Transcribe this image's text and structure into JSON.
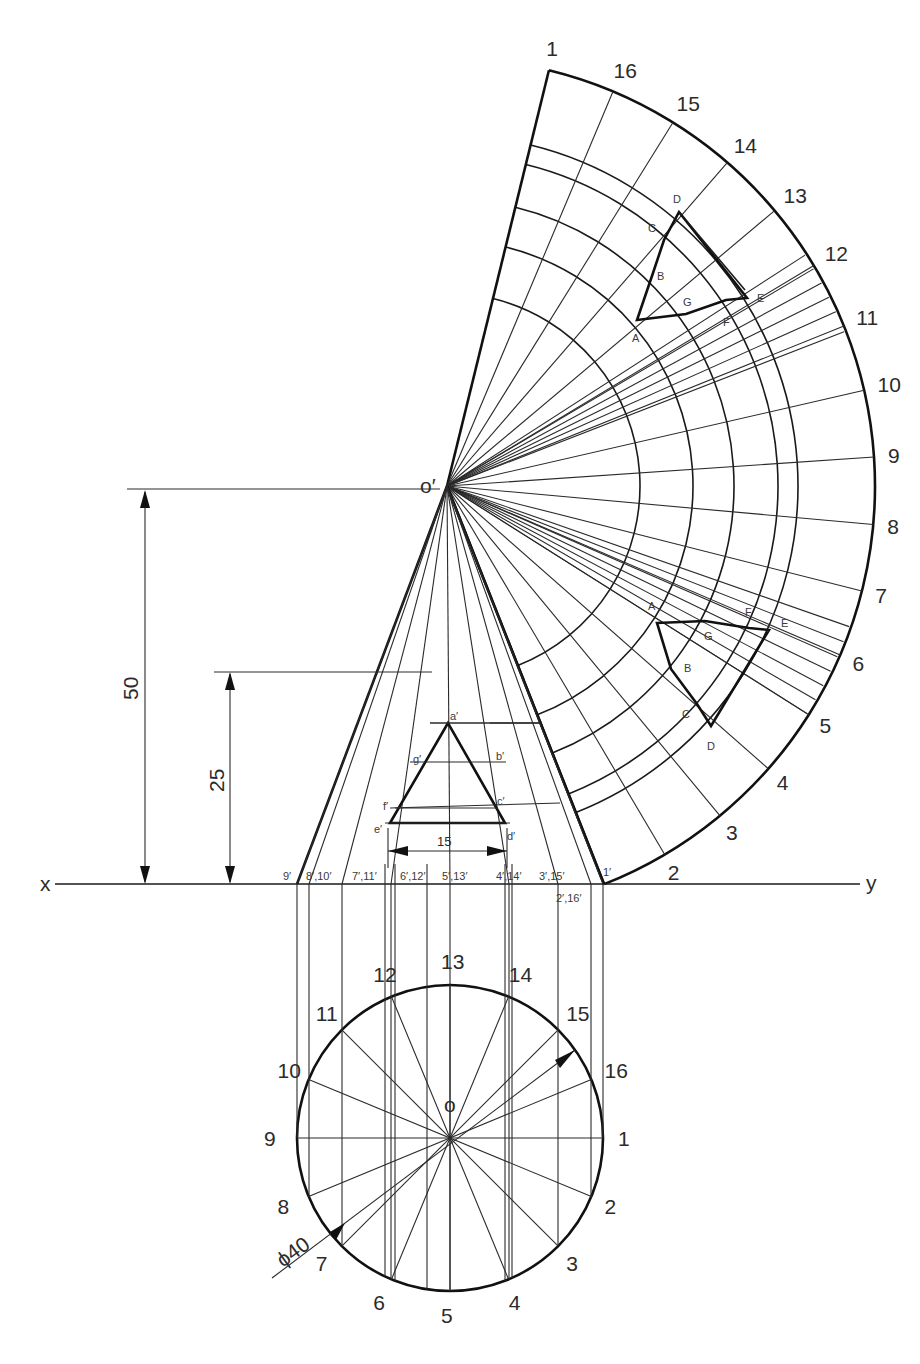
{
  "reference_line": {
    "left_label": "x",
    "right_label": "y"
  },
  "apex_elevation_label": "o′",
  "plan_center_label": "o",
  "dimensions": {
    "cone_height": "50",
    "section_height": "25",
    "triangle_base_width": "15",
    "base_diameter": "ϕ40"
  },
  "plan_generator_labels": [
    "1",
    "2",
    "3",
    "4",
    "5",
    "6",
    "7",
    "8",
    "9",
    "10",
    "11",
    "12",
    "13",
    "14",
    "15",
    "16"
  ],
  "elevation_base_labels": [
    "9′",
    "8′,10′",
    "7′,11′",
    "6′,12′",
    "5′,13′",
    "4′,14′",
    "3′,15′",
    "2′,16′",
    "1′"
  ],
  "elevation_triangle_labels": [
    "a′",
    "b′",
    "c′",
    "d′",
    "e′",
    "f′",
    "g′"
  ],
  "development_generator_labels": [
    "1",
    "2",
    "3",
    "4",
    "5",
    "6",
    "7",
    "8",
    "9",
    "10",
    "11",
    "12",
    "13",
    "14",
    "15",
    "16",
    "1"
  ],
  "development_upper_cut_labels": [
    "A",
    "B",
    "C",
    "D",
    "E",
    "F",
    "G"
  ],
  "development_lower_cut_labels": [
    "A",
    "B",
    "C",
    "D",
    "E",
    "F",
    "G"
  ],
  "geometry": {
    "apex": [
      447,
      486
    ],
    "xy_line_y": 884,
    "base_left": [
      297,
      884
    ],
    "base_right": [
      604,
      884
    ],
    "plan_center": [
      450,
      1138
    ],
    "plan_radius": 153,
    "development_radius": 428,
    "development_arc_radii": [
      193,
      246,
      287,
      331,
      351
    ]
  },
  "colors": {
    "line": "#1a1a1a",
    "background": "#ffffff",
    "text": "#2b2b2b"
  }
}
